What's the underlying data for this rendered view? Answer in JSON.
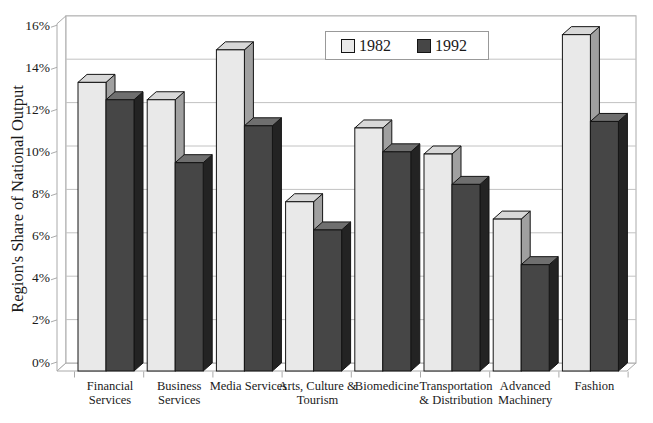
{
  "chart_data": {
    "type": "bar",
    "style": "3d-column",
    "title": "",
    "xlabel": "",
    "ylabel": "Region's Share of National Output",
    "categories": [
      "Financial Services",
      "Business Services",
      "Media Services",
      "Arts, Culture & Tourism",
      "Biomedicine",
      "Transportation & Distribution",
      "Advanced Machinery",
      "Fashion"
    ],
    "category_label_lines": [
      [
        "Financial",
        "Services"
      ],
      [
        "Business",
        "Services"
      ],
      [
        "Media Services"
      ],
      [
        "Arts, Culture &",
        "Tourism"
      ],
      [
        "Biomedicine"
      ],
      [
        "Transportation",
        "& Distribution"
      ],
      [
        "Advanced",
        "Machinery"
      ],
      [
        "Fashion"
      ]
    ],
    "series": [
      {
        "name": "1982",
        "values": [
          13.3,
          12.5,
          14.8,
          7.8,
          11.2,
          10.0,
          7.0,
          15.5
        ]
      },
      {
        "name": "1992",
        "values": [
          12.5,
          9.6,
          11.3,
          6.5,
          10.1,
          8.6,
          4.9,
          11.5
        ]
      }
    ],
    "ylim": [
      0,
      16
    ],
    "ytick_step": 2,
    "ytick_labels": [
      "0%",
      "2%",
      "4%",
      "6%",
      "8%",
      "10%",
      "12%",
      "14%",
      "16%"
    ],
    "grid": "horizontal",
    "legend_position": "top-center"
  },
  "legend": {
    "items": [
      {
        "label": "1982",
        "series_key": "series_1982"
      },
      {
        "label": "1992",
        "series_key": "series_1992"
      }
    ]
  },
  "colors": {
    "series_1982": {
      "front": "#e9e9e9",
      "top": "#d8d8d8",
      "side": "#a0a0a0"
    },
    "series_1992": {
      "front": "#464646",
      "top": "#6f6f6f",
      "side": "#232323"
    },
    "outline": "#141414",
    "gridline": "#c2c2c2",
    "wall": "#aaaaaa",
    "text": "#1a1a1a",
    "background": "#ffffff"
  }
}
